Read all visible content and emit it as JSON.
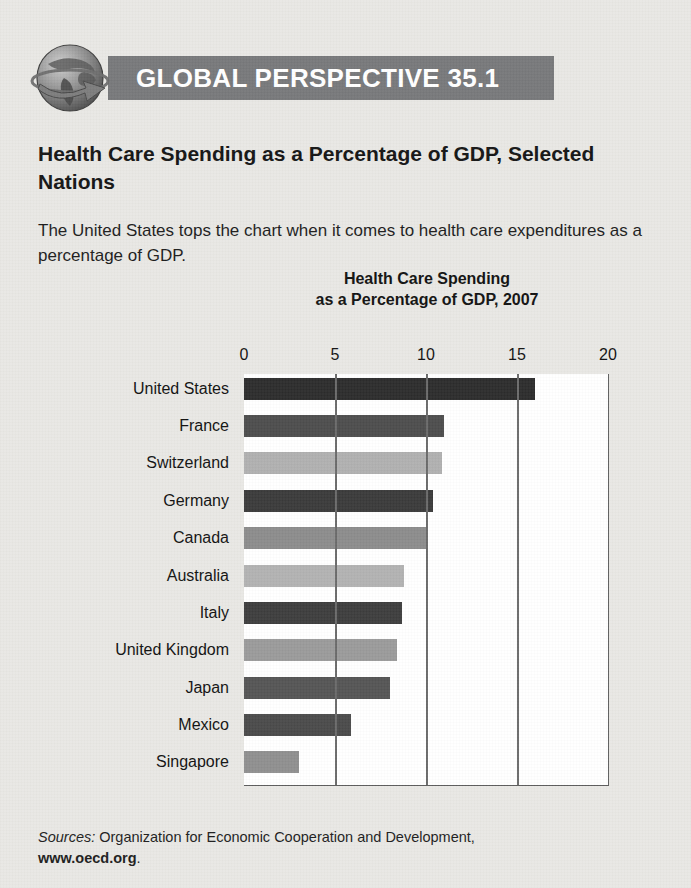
{
  "banner": {
    "title": "GLOBAL PERSPECTIVE 35.1",
    "icon": "globe-arrow-icon",
    "background_color": "#77787a",
    "text_color": "#ffffff"
  },
  "feature": {
    "title": "Health Care Spending as a Percentage of GDP, Selected Nations",
    "description": "The United States tops the chart when it comes to health care expenditures as a percentage of GDP."
  },
  "sources": {
    "lead": "Sources:",
    "text": " Organization for Economic Cooperation and Development,",
    "url": "www.oecd.org",
    "period": "."
  },
  "chart_data": {
    "type": "bar",
    "orientation": "horizontal",
    "title": "Health Care Spending as a Percentage of GDP, 2007",
    "title_line1": "Health Care Spending",
    "title_line2": "as a Percentage of GDP, 2007",
    "xlabel": "",
    "ylabel": "",
    "xlim": [
      0,
      20
    ],
    "xticks": [
      0,
      5,
      10,
      15,
      20
    ],
    "xtick_labels": [
      "0",
      "5",
      "10",
      "15",
      "20"
    ],
    "grid": "vertical",
    "legend": "none",
    "categories": [
      "United States",
      "France",
      "Switzerland",
      "Germany",
      "Canada",
      "Australia",
      "Italy",
      "United Kingdom",
      "Japan",
      "Mexico",
      "Singapore"
    ],
    "values": [
      16.0,
      11.0,
      10.9,
      10.4,
      10.0,
      8.8,
      8.7,
      8.4,
      8.0,
      5.9,
      3.0
    ],
    "bar_colors": [
      "#2c2c2c",
      "#4d4d4d",
      "#b0b0b0",
      "#3a3a3a",
      "#8c8c8c",
      "#b2b2b2",
      "#3d3d3d",
      "#9a9a9a",
      "#555555",
      "#4a4a4a",
      "#8f8f8f"
    ],
    "plot_background": "#ffffff",
    "axis_color": "#5e5e5e"
  }
}
